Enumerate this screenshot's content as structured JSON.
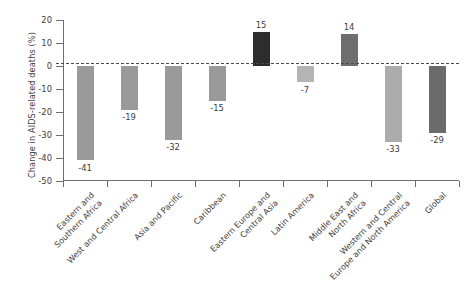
{
  "chart_data": {
    "type": "bar",
    "title": "",
    "subtitle": "",
    "xlabel": "",
    "ylabel": "Change in AIDS-related deaths (%)",
    "ylim": [
      -50,
      20
    ],
    "ytick_values": [
      20,
      10,
      0,
      -10,
      -20,
      -30,
      -40,
      -50
    ],
    "ytick_labels": [
      "20",
      "10",
      "0",
      "-10",
      "-20",
      "-30",
      "-40",
      "-50"
    ],
    "grid": false,
    "legend": "none",
    "zero_reference_line": true,
    "categories": [
      "Eastern and\nSouthern Africa",
      "West and Central Africa",
      "Asia and Pacific",
      "Caribbean",
      "Eastern Europe and\nCentral Asia",
      "Latin America",
      "Middle East and\nNorth Africa",
      "Western and Central\nEurope and North America",
      "Global"
    ],
    "values": [
      -41,
      -19,
      -32,
      -15,
      15,
      -7,
      14,
      -33,
      -29
    ],
    "value_labels": [
      "-41",
      "-19",
      "-32",
      "-15",
      "15",
      "-7",
      "14",
      "-33",
      "-29"
    ],
    "bar_colors": [
      "#9a9a9a",
      "#9a9a9a",
      "#9a9a9a",
      "#9a9a9a",
      "#2d2d2d",
      "#b4b4b4",
      "#6e6e6e",
      "#ababab",
      "#6b6b6b"
    ]
  },
  "colors": {
    "background": "#ffffff",
    "axis": "#6f6f6f",
    "text": "#3d3d3d",
    "zero_line": "#4a4a4a"
  }
}
